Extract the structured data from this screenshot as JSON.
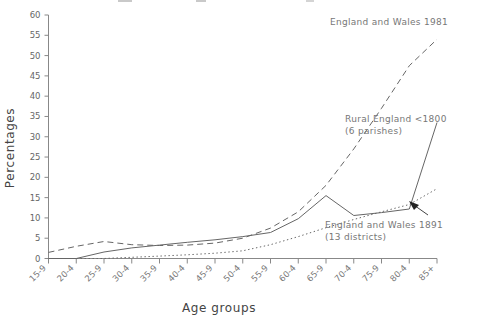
{
  "chart_data": {
    "type": "line",
    "title": "",
    "xlabel": "Age groups",
    "ylabel": "Percentages",
    "ylim": [
      0,
      60
    ],
    "yticks": [
      0,
      5,
      10,
      15,
      20,
      25,
      30,
      35,
      40,
      45,
      50,
      55,
      60
    ],
    "grid": false,
    "legend": "inline annotations",
    "categories": [
      "15-9",
      "20-4",
      "25-9",
      "30-4",
      "35-9",
      "40-4",
      "45-9",
      "50-4",
      "55-9",
      "60-4",
      "65-9",
      "70-4",
      "75-9",
      "80-4",
      "85+"
    ],
    "series": [
      {
        "name": "England and Wales 1981",
        "style": "dashed",
        "color": "#666666",
        "values": [
          1.5,
          3.0,
          4.2,
          3.4,
          3.2,
          3.3,
          3.8,
          5.0,
          7.5,
          11.5,
          18.0,
          27.0,
          37.0,
          47.5,
          54.0
        ]
      },
      {
        "name": "Rural England <1800 (6 parishes)",
        "style": "solid",
        "color": "#555555",
        "values": [
          0.0,
          0.0,
          1.6,
          2.6,
          3.3,
          4.0,
          4.6,
          5.4,
          6.4,
          9.8,
          15.5,
          10.6,
          11.3,
          12.2,
          33.5
        ]
      },
      {
        "name": "England and Wales 1891 (13 districts)",
        "style": "dotted",
        "color": "#888888",
        "values": [
          0.0,
          0.0,
          0.0,
          0.3,
          0.6,
          0.9,
          1.3,
          1.9,
          3.4,
          5.4,
          7.6,
          9.6,
          11.5,
          13.3,
          17.2
        ]
      }
    ],
    "annotations": [
      {
        "id": "annot-1981",
        "lines": [
          "England and Wales 1981"
        ]
      },
      {
        "id": "annot-rural",
        "lines": [
          "Rural England <1800",
          "(6 parishes)"
        ]
      },
      {
        "id": "annot-1891",
        "lines": [
          "England and Wales 1891",
          "(13 districts)"
        ]
      }
    ]
  },
  "labels": {
    "y_axis_title": "Percentages",
    "x_axis_title": "Age groups",
    "yticks": [
      "0",
      "5",
      "10",
      "15",
      "20",
      "25",
      "30",
      "35",
      "40",
      "45",
      "50",
      "55",
      "60"
    ],
    "xticks": [
      "15-9",
      "20-4",
      "25-9",
      "30-4",
      "35-9",
      "40-4",
      "45-9",
      "50-4",
      "55-9",
      "60-4",
      "65-9",
      "70-4",
      "75-9",
      "80-4",
      "85+"
    ],
    "annot_1981": "England and Wales 1981",
    "annot_rural_l1": "Rural England <1800",
    "annot_rural_l2": "(6 parishes)",
    "annot_1891_l1": "England and Wales 1891",
    "annot_1891_l2": "(13 districts)"
  },
  "colors": {
    "axis": "#888888",
    "text": "#666666",
    "series_1981": "#666666",
    "series_rural": "#555555",
    "series_1891": "#888888",
    "background": "#ffffff"
  }
}
